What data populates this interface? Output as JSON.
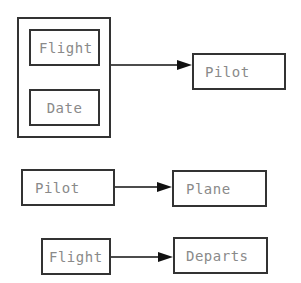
{
  "diagram": {
    "type": "functional-dependency",
    "nodes": [
      {
        "id": "group1",
        "label": "",
        "kind": "group",
        "members": [
          "flight1",
          "date1"
        ]
      },
      {
        "id": "flight1",
        "label": "Flight"
      },
      {
        "id": "date1",
        "label": "Date"
      },
      {
        "id": "pilot1",
        "label": "Pilot"
      },
      {
        "id": "pilot2",
        "label": "Pilot"
      },
      {
        "id": "plane",
        "label": "Plane"
      },
      {
        "id": "flight2",
        "label": "Flight"
      },
      {
        "id": "departs",
        "label": "Departs"
      }
    ],
    "edges": [
      {
        "from": "group1",
        "to": "pilot1"
      },
      {
        "from": "pilot2",
        "to": "plane"
      },
      {
        "from": "flight2",
        "to": "departs"
      }
    ],
    "colors": {
      "border": "#333333",
      "text": "#8a8a8a",
      "arrow": "#111111"
    }
  }
}
